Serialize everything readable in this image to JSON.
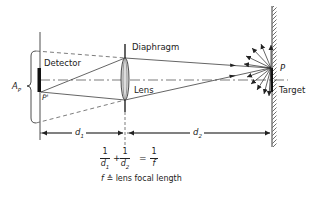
{
  "diagram": {
    "labels": {
      "detector": "Detector",
      "diaphragm": "Diaphragm",
      "lens": "Lens",
      "target": "Target",
      "point_P": "P",
      "point_P_prime": "P'",
      "aperture": "A",
      "aperture_sub": "P",
      "d1": "d",
      "d1_sub": "1",
      "d2": "d",
      "d2_sub": "2"
    },
    "equation": {
      "num1": "1",
      "den1": "d",
      "den1_sub": "1",
      "plus": "+",
      "num2": "1",
      "den2": "d",
      "den2_sub": "2",
      "equals": "=",
      "num3": "1",
      "den3": "f"
    },
    "definition": {
      "symbol": "f",
      "relation": "≙",
      "text": "lens focal length"
    },
    "colors": {
      "line": "#222222",
      "background": "#ffffff"
    }
  }
}
